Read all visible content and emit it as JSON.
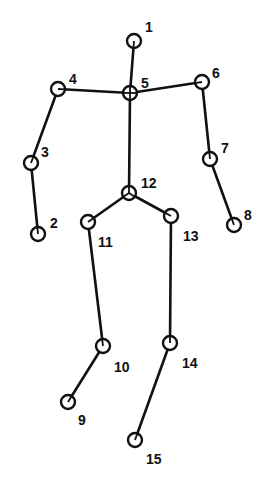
{
  "colors": {
    "stroke": "#111111",
    "background": "#ffffff"
  },
  "joints": [
    {
      "id": "1",
      "x": 134,
      "y": 41,
      "lx": 145,
      "ly": 28,
      "type": "plain"
    },
    {
      "id": "2",
      "x": 38,
      "y": 234,
      "lx": 50,
      "ly": 224,
      "type": "plain"
    },
    {
      "id": "3",
      "x": 31,
      "y": 163,
      "lx": 41,
      "ly": 153,
      "type": "plain"
    },
    {
      "id": "4",
      "x": 58,
      "y": 89,
      "lx": 69,
      "ly": 80,
      "type": "plain"
    },
    {
      "id": "5",
      "x": 130,
      "y": 93,
      "lx": 141,
      "ly": 84,
      "type": "cross"
    },
    {
      "id": "6",
      "x": 202,
      "y": 82,
      "lx": 212,
      "ly": 74,
      "type": "plain"
    },
    {
      "id": "7",
      "x": 210,
      "y": 159,
      "lx": 221,
      "ly": 149,
      "type": "plain"
    },
    {
      "id": "8",
      "x": 234,
      "y": 225,
      "lx": 244,
      "ly": 216,
      "type": "plain"
    },
    {
      "id": "9",
      "x": 68,
      "y": 402,
      "lx": 78,
      "ly": 421,
      "type": "plain"
    },
    {
      "id": "10",
      "x": 103,
      "y": 346,
      "lx": 114,
      "ly": 368,
      "type": "plain"
    },
    {
      "id": "11",
      "x": 88,
      "y": 222,
      "lx": 98,
      "ly": 243,
      "type": "plain"
    },
    {
      "id": "12",
      "x": 129,
      "y": 193,
      "lx": 141,
      "ly": 184,
      "type": "tri"
    },
    {
      "id": "13",
      "x": 171,
      "y": 216,
      "lx": 183,
      "ly": 237,
      "type": "plain"
    },
    {
      "id": "14",
      "x": 170,
      "y": 343,
      "lx": 182,
      "ly": 364,
      "type": "plain"
    },
    {
      "id": "15",
      "x": 135,
      "y": 440,
      "lx": 146,
      "ly": 460,
      "type": "plain"
    }
  ],
  "bones": [
    [
      "1",
      "5"
    ],
    [
      "4",
      "5"
    ],
    [
      "5",
      "6"
    ],
    [
      "4",
      "3"
    ],
    [
      "3",
      "2"
    ],
    [
      "6",
      "7"
    ],
    [
      "7",
      "8"
    ],
    [
      "5",
      "12"
    ],
    [
      "12",
      "11"
    ],
    [
      "12",
      "13"
    ],
    [
      "11",
      "10"
    ],
    [
      "10",
      "9"
    ],
    [
      "13",
      "14"
    ],
    [
      "14",
      "15"
    ]
  ]
}
